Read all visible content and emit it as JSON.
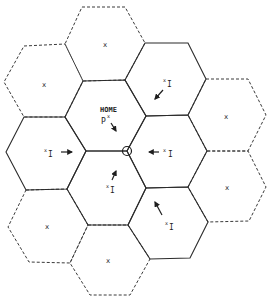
{
  "diagram": {
    "colors": {
      "line": "#2b2b2b",
      "background": "#ffffff"
    },
    "home_label": "HOME",
    "home_point_label": "P",
    "home_point_sup": "x",
    "receiver_marker": "circle at shared vertex",
    "cells": [
      {
        "id": "top",
        "style": "dashed",
        "label": "x"
      },
      {
        "id": "upper-left",
        "style": "dashed",
        "label": "x"
      },
      {
        "id": "upper-right",
        "style": "solid",
        "label": "I",
        "sup": "x"
      },
      {
        "id": "home",
        "style": "solid",
        "label": "HOME P",
        "sup": "x"
      },
      {
        "id": "right-upper",
        "style": "dashed",
        "label": "x"
      },
      {
        "id": "left",
        "style": "solid",
        "label": "I",
        "sup": "x"
      },
      {
        "id": "right-center",
        "style": "solid",
        "label": "I",
        "sup": "x"
      },
      {
        "id": "lower-center",
        "style": "solid",
        "label": "I",
        "sup": "x"
      },
      {
        "id": "right-lower",
        "style": "dashed",
        "label": "x"
      },
      {
        "id": "lower-left",
        "style": "dashed",
        "label": "x"
      },
      {
        "id": "lower-right",
        "style": "solid",
        "label": "I",
        "sup": "x"
      },
      {
        "id": "bottom",
        "style": "dashed",
        "label": "x"
      }
    ],
    "labels": {
      "x": "x",
      "I": "I",
      "sup_x": "x"
    }
  }
}
